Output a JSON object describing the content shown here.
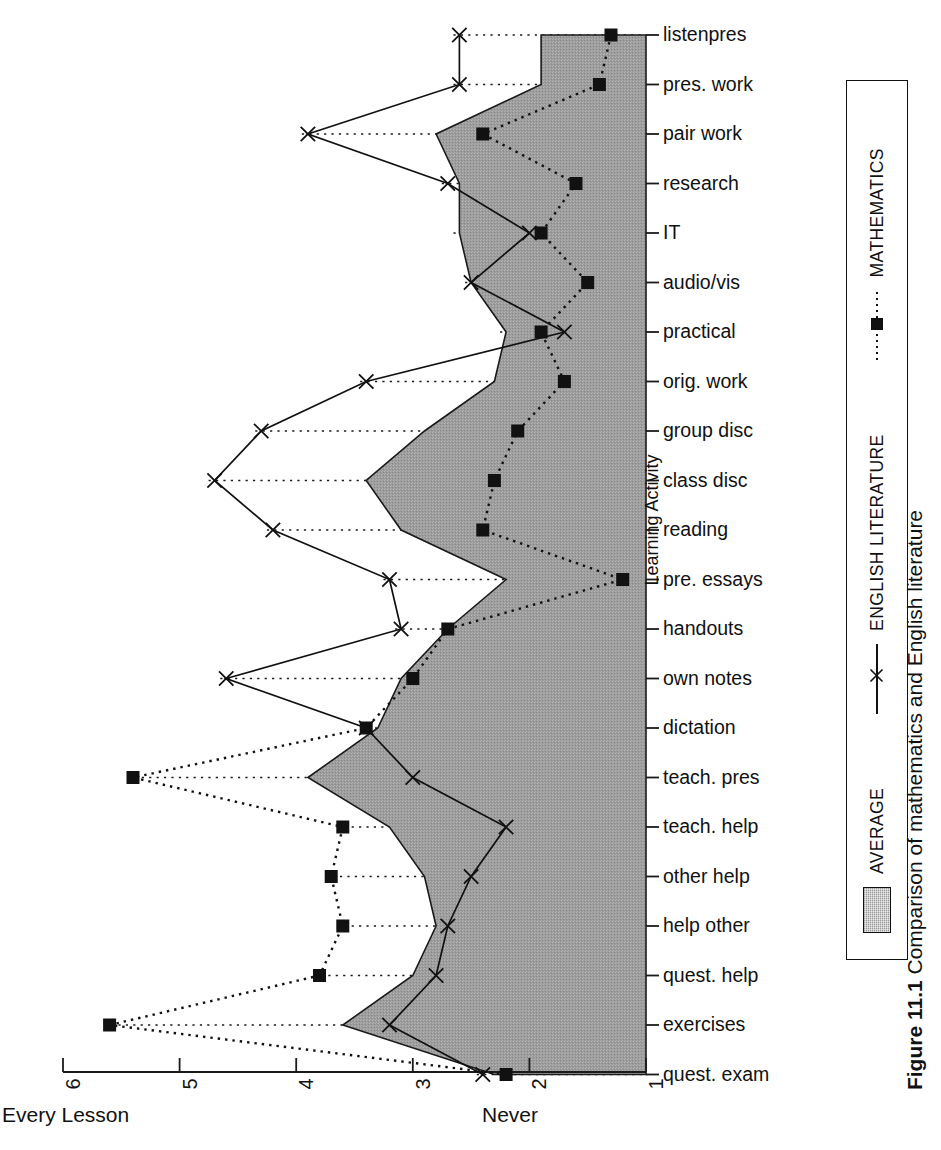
{
  "figure": {
    "caption_number": "Figure 11.1",
    "caption_text": "Comparison of mathematics and English literature"
  },
  "axes": {
    "category_axis_title": "Learning Activity",
    "value_axis_ticks": [
      "6",
      "5",
      "4",
      "3",
      "2",
      "1"
    ],
    "value_axis_end_left": "Every Lesson",
    "value_axis_end_right": "Never"
  },
  "legend": {
    "items": [
      {
        "label": "AVERAGE",
        "style": "area-fill",
        "color": "#9b9b9b"
      },
      {
        "label": "ENGLISH LITERATURE",
        "style": "solid-line-x-marker",
        "color": "#111111"
      },
      {
        "label": "MATHEMATICS",
        "style": "dotted-line-square-marker",
        "color": "#111111"
      }
    ]
  },
  "chart_data": {
    "type": "line",
    "title": "Comparison of mathematics and English literature",
    "orientation": "horizontal-categories-on-right",
    "xlabel": "",
    "ylabel": "Learning Activity",
    "xlim": [
      6,
      1
    ],
    "x_tick_values": [
      6,
      5,
      4,
      3,
      2,
      1
    ],
    "x_axis_left_caption": "Every Lesson",
    "x_axis_right_caption": "Never",
    "grid": "dotted-horizontal-per-category",
    "legend_position": "right-rotated",
    "categories": [
      "listenpres",
      "pres. work",
      "pair work",
      "research",
      "IT",
      "audio/vis",
      "practical",
      "orig. work",
      "group disc",
      "class disc",
      "reading",
      "pre. essays",
      "handouts",
      "own notes",
      "dictation",
      "teach. pres",
      "teach. help",
      "other help",
      "help other",
      "quest. help",
      "exercises",
      "quest. exam"
    ],
    "series": [
      {
        "name": "AVERAGE",
        "style": "area-fill",
        "values": [
          1.9,
          1.9,
          2.8,
          2.6,
          2.6,
          2.5,
          2.2,
          2.3,
          2.9,
          3.4,
          3.1,
          2.2,
          2.7,
          3.1,
          3.3,
          3.9,
          3.2,
          2.9,
          2.8,
          3.0,
          3.6,
          2.3
        ]
      },
      {
        "name": "ENGLISH LITERATURE",
        "style": "solid-line-x-marker",
        "values": [
          2.6,
          2.6,
          3.9,
          2.7,
          2.0,
          2.5,
          1.7,
          3.4,
          4.3,
          4.7,
          4.2,
          3.2,
          3.1,
          4.6,
          3.4,
          3.0,
          2.2,
          2.5,
          2.7,
          2.8,
          3.2,
          2.4
        ]
      },
      {
        "name": "MATHEMATICS",
        "style": "dotted-line-square-marker",
        "values": [
          1.3,
          1.4,
          2.4,
          1.6,
          1.9,
          1.5,
          1.9,
          1.7,
          2.1,
          2.3,
          2.4,
          1.2,
          2.7,
          3.0,
          3.4,
          5.4,
          3.6,
          3.7,
          3.6,
          3.8,
          5.6,
          2.2
        ]
      }
    ]
  },
  "geometry": {
    "plot_left": 63,
    "plot_right": 646,
    "first_row_y": 35,
    "row_step": 49.5,
    "tick_step_px": 116.6,
    "baseline_value": 1
  }
}
